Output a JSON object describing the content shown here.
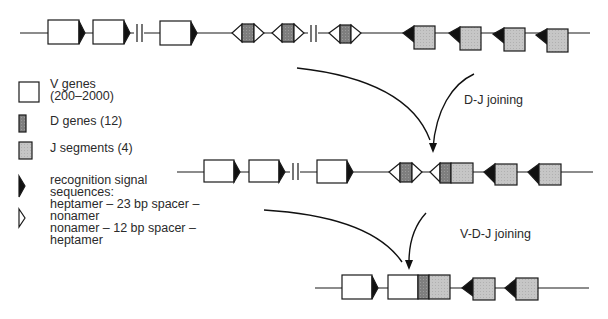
{
  "diagram": {
    "title": "",
    "colors": {
      "line": "#1a1a1a",
      "v_gene_fill": "#ffffff",
      "d_gene_fill": "#8a8a8a",
      "j_segment_fill": "#c4c4c4",
      "rss_23_fill": "#111111",
      "rss_12_fill": "#ffffff"
    },
    "steps": [
      {
        "label": "D-J joining"
      },
      {
        "label": "V-D-J joining"
      }
    ],
    "rows": [
      {
        "name": "germline",
        "elements": [
          "V",
          "V",
          "break",
          "V",
          "D",
          "D",
          "break",
          "D",
          "J",
          "J",
          "J",
          "J"
        ]
      },
      {
        "name": "after-dj-joining",
        "elements": [
          "V",
          "V",
          "break",
          "V",
          "D",
          "DJ",
          "J",
          "J"
        ]
      },
      {
        "name": "after-vdj-joining",
        "elements": [
          "V",
          "VDJ",
          "J",
          "J"
        ]
      }
    ]
  },
  "legend": {
    "items": [
      {
        "symbol": "white-box",
        "lines": [
          "V genes",
          "(200–2000)"
        ]
      },
      {
        "symbol": "dark-gray-box",
        "lines": [
          "D genes (12)"
        ]
      },
      {
        "symbol": "light-gray-box",
        "lines": [
          "J segments (4)"
        ]
      },
      {
        "symbol": "black-triangle",
        "lines": [
          "recognition signal",
          "sequences:",
          "heptamer – 23 bp spacer –",
          "nonamer"
        ]
      },
      {
        "symbol": "white-triangle",
        "lines": [
          "nonamer – 12 bp spacer –",
          "heptamer"
        ]
      }
    ]
  }
}
